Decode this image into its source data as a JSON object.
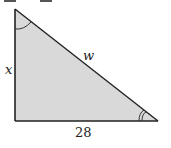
{
  "diagram": {
    "type": "right-triangle",
    "fill_color": "#d9d9d9",
    "stroke_color": "#222222",
    "vertices": {
      "top": [
        15,
        9
      ],
      "right_angle": [
        15,
        121
      ],
      "bottom_right": [
        158,
        121
      ]
    },
    "labels": {
      "vertical_side": "x",
      "hypotenuse": "w",
      "base": "28"
    },
    "angle_marks": {
      "top": "single-arc",
      "bottom_right": "double-arc"
    }
  }
}
